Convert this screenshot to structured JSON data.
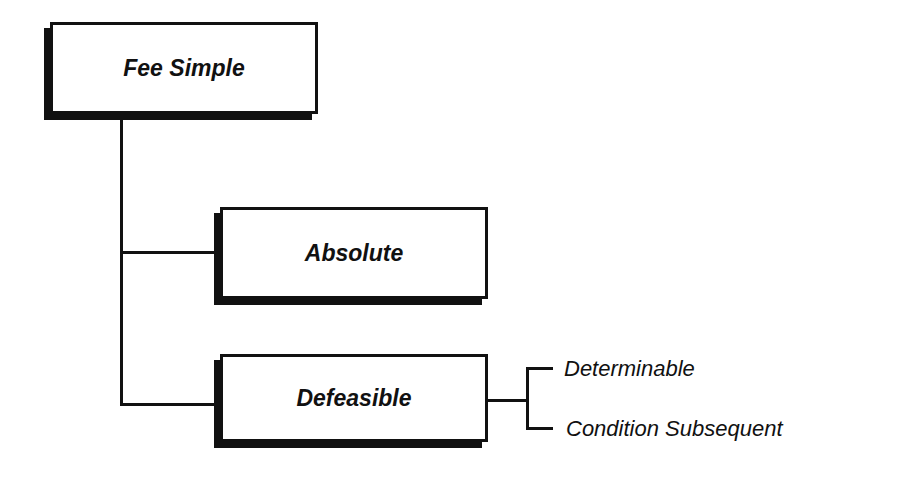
{
  "diagram": {
    "root": {
      "label": "Fee Simple"
    },
    "children": [
      {
        "label": "Absolute"
      },
      {
        "label": "Defeasible",
        "subtypes": [
          {
            "label": "Determinable"
          },
          {
            "label": "Condition Subsequent"
          }
        ]
      }
    ]
  },
  "colors": {
    "stroke": "#111111",
    "background": "#ffffff"
  }
}
